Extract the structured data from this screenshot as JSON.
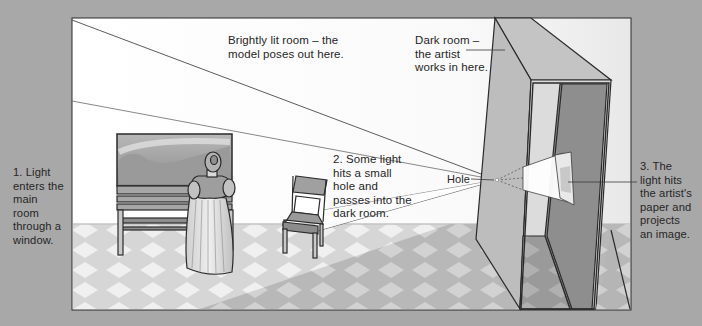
{
  "diagram": {
    "colors": {
      "background": "#a8a8a8",
      "wall": "#ffffff",
      "floor_light": "#d9d9d9",
      "floor_tile": "#f2f2f2",
      "floor_shadow": "#bdbdbd",
      "dark_room_front": "#b9b9b9",
      "dark_room_top": "#c6c6c6",
      "dark_room_interior": "#8f8f8f",
      "outline": "#2a2a2a"
    },
    "labels": {
      "window": "1. Light\nenters the\nmain\nroom\nthrough a\nwindow.",
      "hole_step": "2. Some light\nhits a small\nhole and\npasses into the\ndark room.",
      "paper": "3. The\nlight hits\nthe artist's\npaper and\nprojects\nan image.",
      "bright_room": "Brightly lit room –  the\nmodel poses out here.",
      "dark_room": "Dark room –\nthe artist\nworks in here.",
      "hole": "Hole"
    },
    "objects": [
      "window-painting",
      "bench",
      "model-woman",
      "chair",
      "light-cone",
      "pinhole",
      "projection-pyramid",
      "artist-paper",
      "dark-room-box",
      "checkered-floor"
    ]
  }
}
